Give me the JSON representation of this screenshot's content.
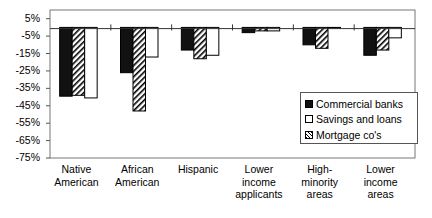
{
  "chart_data": {
    "type": "bar",
    "title": "",
    "xlabel": "",
    "ylabel": "",
    "ylim": [
      -75,
      10
    ],
    "yticks": [
      "5%",
      "-5%",
      "-15%",
      "-25%",
      "-35%",
      "-45%",
      "-55%",
      "-65%",
      "-75%"
    ],
    "ytick_values": [
      5,
      -5,
      -15,
      -25,
      -35,
      -45,
      -55,
      -65,
      -75
    ],
    "categories": [
      "Native American",
      "African American",
      "Hispanic",
      "Lower income applicants",
      "High-minority areas",
      "Lower income areas"
    ],
    "category_lines": [
      [
        "Native",
        "American"
      ],
      [
        "African",
        "American"
      ],
      [
        "Hispanic"
      ],
      [
        "Lower",
        "income",
        "applicants"
      ],
      [
        "High-",
        "minority",
        "areas"
      ],
      [
        "Lower",
        "income",
        "areas"
      ]
    ],
    "series": [
      {
        "name": "Commercial banks",
        "fill": "black",
        "values": [
          -39.5,
          -26,
          -13,
          -3,
          -10,
          -16
        ]
      },
      {
        "name": "Mortgage co's",
        "fill": "hatched",
        "values": [
          -39,
          -48,
          -18,
          -2,
          -12,
          -13
        ]
      },
      {
        "name": "Savings and loans",
        "fill": "white",
        "values": [
          -40.5,
          -17,
          -16,
          -2,
          0,
          -6
        ]
      }
    ],
    "legend": {
      "position": "right-inside",
      "entries": [
        {
          "label": "Commercial banks",
          "fill": "black"
        },
        {
          "label": "Savings and loans",
          "fill": "white"
        },
        {
          "label": "Mortgage co's",
          "fill": "hatched"
        }
      ]
    },
    "grid": false
  }
}
